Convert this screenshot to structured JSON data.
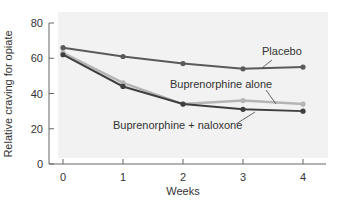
{
  "chart_data": {
    "type": "line",
    "title": "",
    "xlabel": "Weeks",
    "ylabel": "Relative craving for opiate",
    "x": [
      0,
      1,
      2,
      3,
      4
    ],
    "x_tick_labels": [
      "0",
      "1",
      "2",
      "3",
      "4"
    ],
    "y_ticks": [
      0,
      20,
      40,
      60,
      80
    ],
    "y_tick_labels": [
      "0",
      "20",
      "40",
      "60",
      "80"
    ],
    "ylim": [
      0,
      80
    ],
    "xlim": [
      0,
      4
    ],
    "grid": false,
    "legend_position": "inline labels",
    "series": [
      {
        "name": "Placebo",
        "values": [
          66,
          61,
          57,
          54,
          55
        ],
        "color": "#5a5a5a",
        "label_pos": {
          "x": 262,
          "y": 55
        },
        "leader": [
          [
            272,
            60
          ],
          [
            262,
            68
          ]
        ]
      },
      {
        "name": "Buprenorphine alone",
        "values": [
          63,
          46,
          34,
          36,
          34
        ],
        "color": "#b5b5b5",
        "label_pos": {
          "x": 170,
          "y": 88
        },
        "leader": [
          [
            266,
            90
          ],
          [
            276,
            104
          ]
        ]
      },
      {
        "name": "Buprenorphine + naloxone",
        "values": [
          62,
          44,
          34,
          31,
          30
        ],
        "color": "#3f3f3f",
        "label_pos": {
          "x": 113,
          "y": 129
        },
        "leader": [
          [
            236,
            124
          ],
          [
            255,
            112
          ]
        ]
      }
    ],
    "panel_color": "#f2f2f2"
  }
}
